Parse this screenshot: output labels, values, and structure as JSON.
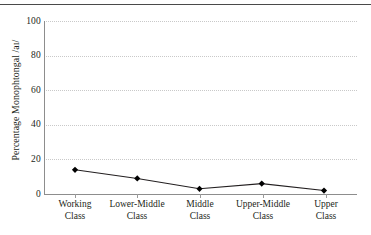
{
  "chart_data": {
    "type": "line",
    "title": "",
    "xlabel": "",
    "ylabel": "Percentage Monophtongal /aɪ/",
    "categories": [
      "Working Class",
      "Lower-Middle Class",
      "Middle Class",
      "Upper-Middle Class",
      "Upper Class"
    ],
    "category_lines": [
      [
        "Working",
        "Class"
      ],
      [
        "Lower-Middle",
        "Class"
      ],
      [
        "Middle",
        "Class"
      ],
      [
        "Upper-Middle",
        "Class"
      ],
      [
        "Upper",
        "Class"
      ]
    ],
    "values": [
      14,
      9,
      3,
      6,
      2
    ],
    "ylim": [
      0,
      100
    ],
    "yticks": [
      0,
      20,
      40,
      60,
      80,
      100
    ],
    "ytick_labels": [
      "0",
      "20",
      "40",
      "60",
      "80",
      "100"
    ],
    "grid": true,
    "grid_style": "dotted",
    "legend": false,
    "marker": "diamond",
    "colors": {
      "line": "#231f20",
      "marker": "#000000",
      "grid": "#c9c9c9",
      "axis": "#8d8d8d",
      "rule": "#4a4a4a",
      "text": "#231f20",
      "background": "#ffffff"
    }
  }
}
